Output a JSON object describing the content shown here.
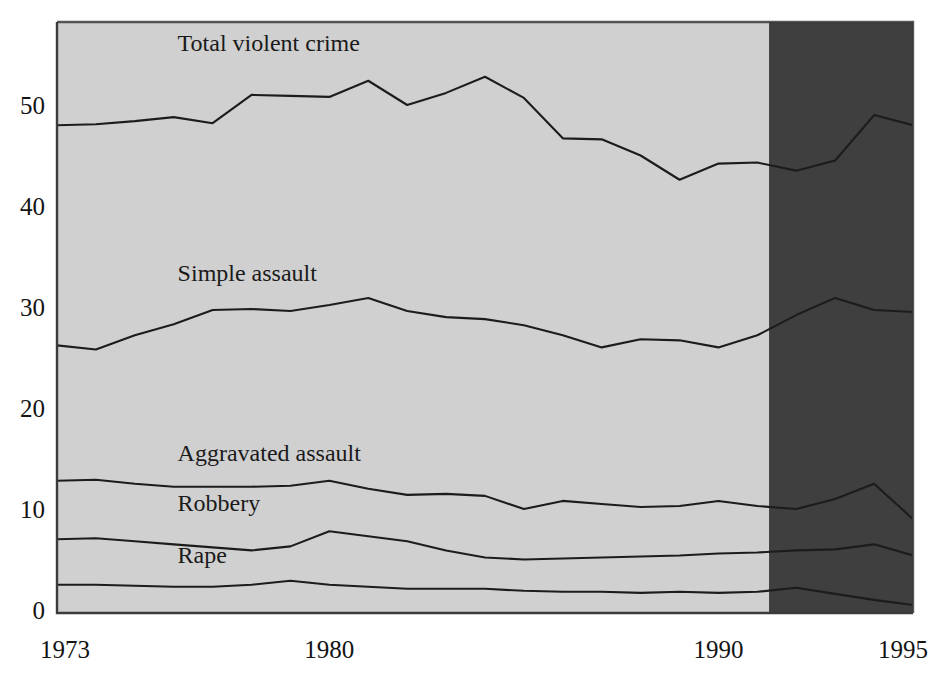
{
  "chart_data": {
    "type": "line",
    "title": "",
    "subtitle": "",
    "xlabel": "",
    "ylabel": "",
    "xlim": [
      1973,
      1995
    ],
    "ylim": [
      0,
      57
    ],
    "grid": false,
    "legend_position": "inline-labels",
    "y_ticks": [
      0,
      10,
      20,
      30,
      40,
      50
    ],
    "y_tick_labels": [
      "0",
      "10",
      "20",
      "30",
      "40",
      "50"
    ],
    "x_ticks": [
      1973,
      1980,
      1990,
      1995
    ],
    "x_tick_labels": [
      "1973",
      "1980",
      "1990",
      "1995"
    ],
    "x": [
      1973,
      1974,
      1975,
      1976,
      1977,
      1978,
      1979,
      1980,
      1981,
      1982,
      1983,
      1984,
      1985,
      1986,
      1987,
      1988,
      1989,
      1990,
      1991,
      1992,
      1993,
      1994,
      1995
    ],
    "series": [
      {
        "name": "Total violent crime",
        "label": "Total violent crime",
        "label_x": 1976.1,
        "label_y": 55.3,
        "values": [
          48.0,
          48.1,
          48.4,
          48.8,
          48.2,
          51.0,
          50.9,
          50.8,
          52.4,
          50.0,
          51.2,
          52.8,
          50.7,
          46.7,
          46.6,
          45.0,
          42.6,
          44.2,
          44.3,
          43.5,
          44.5,
          49.0,
          48.0
        ]
      },
      {
        "name": "Simple assault",
        "label": "Simple assault",
        "label_x": 1976.1,
        "label_y": 32.6,
        "values": [
          26.2,
          25.8,
          27.2,
          28.3,
          29.7,
          29.8,
          29.6,
          30.2,
          30.9,
          29.6,
          29.0,
          28.8,
          28.2,
          27.2,
          26.0,
          26.8,
          26.7,
          26.0,
          27.2,
          29.2,
          30.9,
          29.7,
          29.5
        ]
      },
      {
        "name": "Aggravated assault",
        "label": "Aggravated assault",
        "label_x": 1976.1,
        "label_y": 14.8,
        "values": [
          12.8,
          12.9,
          12.5,
          12.2,
          12.2,
          12.2,
          12.3,
          12.8,
          12.0,
          11.4,
          11.5,
          11.3,
          10.0,
          10.8,
          10.5,
          10.2,
          10.3,
          10.8,
          10.3,
          10.0,
          11.0,
          12.5,
          9.0
        ]
      },
      {
        "name": "Robbery",
        "label": "Robbery",
        "label_x": 1976.1,
        "label_y": 9.8,
        "values": [
          7.0,
          7.1,
          6.8,
          6.5,
          6.2,
          5.9,
          6.3,
          7.8,
          7.3,
          6.8,
          5.9,
          5.2,
          5.0,
          5.1,
          5.2,
          5.3,
          5.4,
          5.6,
          5.7,
          5.9,
          6.0,
          6.5,
          5.4
        ]
      },
      {
        "name": "Rape",
        "label": "Rape",
        "label_x": 1976.1,
        "label_y": 4.7,
        "values": [
          2.5,
          2.5,
          2.4,
          2.3,
          2.3,
          2.5,
          2.9,
          2.5,
          2.3,
          2.1,
          2.1,
          2.1,
          1.9,
          1.8,
          1.8,
          1.7,
          1.8,
          1.7,
          1.8,
          2.2,
          1.6,
          1.0,
          0.5
        ]
      }
    ],
    "annotations": [
      {
        "name": "redesign-shading",
        "kind": "shaded-region",
        "x_start": 1991.3,
        "x_end": 1995,
        "color": "#3f3f3f"
      }
    ],
    "plot_background": "#d0d0d0",
    "line_color": "#1c1c1c",
    "border_color": "#3b3b3b"
  }
}
